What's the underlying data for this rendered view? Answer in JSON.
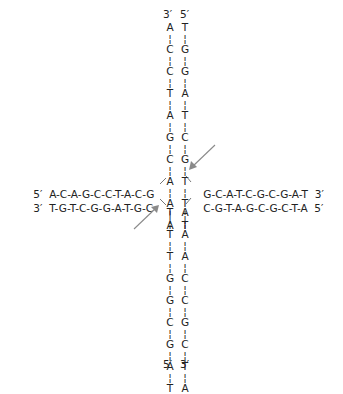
{
  "diagram": {
    "top_arm": {
      "labels": [
        "3′",
        "5′"
      ],
      "left_strand": [
        "A",
        "C",
        "C",
        "T",
        "A",
        "G",
        "C",
        "A",
        "A",
        "A"
      ],
      "right_strand": [
        "T",
        "G",
        "G",
        "A",
        "T",
        "C",
        "G",
        "T",
        "T",
        "T"
      ]
    },
    "bottom_arm": {
      "labels": [
        "5′",
        "3′"
      ],
      "left_strand": [
        "T",
        "T",
        "T",
        "G",
        "G",
        "C",
        "G",
        "A",
        "T"
      ],
      "right_strand": [
        "A",
        "A",
        "A",
        "C",
        "C",
        "G",
        "C",
        "T",
        "A"
      ]
    },
    "left_arm": {
      "top_strand": {
        "end_label": "5′",
        "sequence": "A-C-A-G-C-C-T-A-C-G"
      },
      "bottom_strand": {
        "end_label": "3′",
        "sequence": "T-G-T-C-G-G-A-T-G-C"
      }
    },
    "right_arm": {
      "top_strand": {
        "end_label": "3′",
        "sequence": "G-C-A-T-C-G-C-G-A-T"
      },
      "bottom_strand": {
        "end_label": "5′",
        "sequence": "C-G-T-A-G-C-G-C-T-A"
      }
    },
    "arrows": [
      {
        "name": "upper-right-arrow",
        "points_to": "junction crossover strand T→G",
        "color": "#8a8a8a"
      },
      {
        "name": "lower-left-arrow",
        "points_to": "junction crossover strand C→T",
        "color": "#8a8a8a"
      }
    ]
  }
}
